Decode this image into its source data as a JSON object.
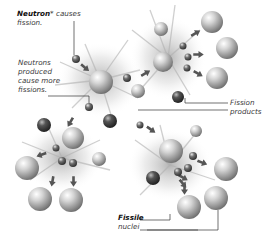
{
  "diagram": {
    "labels": {
      "neutron_bold": "Neutron",
      "neutron_asterisk": "*",
      "neutron_rest": " causes",
      "neutron_line2": "fission.",
      "produced_line1": "Neutrons",
      "produced_line2": "produced",
      "produced_line3": "cause more",
      "produced_line4": "fissions.",
      "fission_line1": "Fission",
      "fission_line2": "products",
      "fissile_bold": "Fissile",
      "fissile_line2": "nuclei"
    },
    "colors": {
      "sphere_light": "#f2f2f2",
      "sphere_mid": "#9a9a9a",
      "sphere_dark": "#3a3a3a",
      "arrow": "#555555",
      "leader_line": "#333333"
    }
  }
}
